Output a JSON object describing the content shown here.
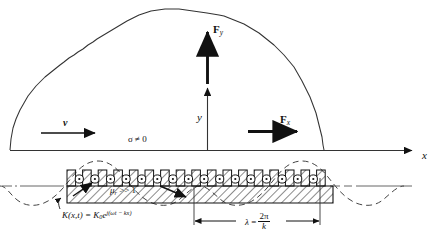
{
  "figure": {
    "axes": {
      "x_label": "x",
      "y_label": "y"
    },
    "labels": {
      "force_y": "F",
      "force_y_sub": "y",
      "force_x": "F",
      "force_x_sub": "x",
      "velocity": "v",
      "conductivity": "σ ≠ 0",
      "permeability": "μ",
      "permeability_sub": "r",
      "permeability_rest": " >> 1",
      "current_sheet_lhs": "K(x,t) = K",
      "current_sheet_sub": "0",
      "current_sheet_exp_base": "e",
      "current_sheet_exp": "j(ωt − kx)",
      "wavelength_symbol": "λ",
      "wavelength_equals": "=",
      "wavelength_num": "2π",
      "wavelength_den": "k"
    },
    "colors": {
      "ink": "#111111",
      "hatch": "#1a1a1a",
      "dashed": "#333333",
      "background": "#ffffff"
    },
    "elements": {
      "conducting_region": "irregular dome boundary, σ ≠ 0 region above the x-axis",
      "x_axis": "horizontal axis with arrowhead at right",
      "y_axis": "vertical axis with arrowhead pointing up",
      "force_y_arrow": "bold upward arrow labeled F_y",
      "force_x_arrow": "bold rightward arrow labeled F_x",
      "velocity_arrow": "thin rightward arrow labeled v",
      "slotted_core": "hatched ferromagnetic core with open slots and conductor circles",
      "conductor_marker": "circle with center dot (current out of page)",
      "travelling_wave": "dashed sinusoidal current-sheet waveform",
      "wavelength_dimension": "double-headed dimension arrow spanning one wavelength"
    },
    "counts": {
      "teeth": 17,
      "slot_conductors": 16
    }
  }
}
